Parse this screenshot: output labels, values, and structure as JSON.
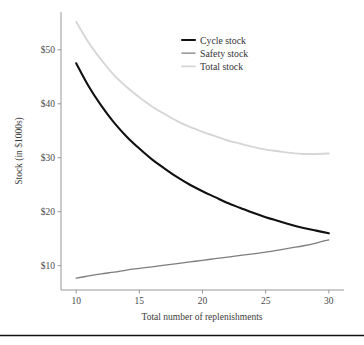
{
  "figure": {
    "background_color": "#ffffff",
    "bottom_rule_color": "#111111",
    "axis_color": "#8c8c8c"
  },
  "chart_data": {
    "type": "line",
    "title": "",
    "subtitle": "",
    "xlabel": "Total number of replenishments",
    "ylabel": "Stock (in $1000s)",
    "xlim": [
      8.8,
      31.2
    ],
    "ylim": [
      5.5,
      57.0
    ],
    "xticks": [
      10,
      15,
      20,
      25,
      30
    ],
    "xticklabels": [
      "10",
      "15",
      "20",
      "25",
      "30"
    ],
    "yticks": [
      10,
      20,
      30,
      40,
      50
    ],
    "yticklabels": [
      "$10",
      "$20",
      "$30",
      "$40",
      "$50"
    ],
    "grid": false,
    "legend_position": "upper center",
    "x": [
      10,
      11,
      12,
      13,
      14,
      15,
      16,
      17,
      18,
      19,
      20,
      21,
      22,
      23,
      24,
      25,
      26,
      27,
      28,
      29,
      30
    ],
    "series": [
      {
        "name": "Cycle stock",
        "color": "#111111",
        "width": 2.1,
        "values": [
          47.5,
          43.2,
          39.6,
          36.5,
          33.9,
          31.7,
          29.7,
          28.0,
          26.4,
          25.0,
          23.8,
          22.7,
          21.6,
          20.7,
          19.8,
          19.0,
          18.3,
          17.6,
          17.0,
          16.5,
          16.0
        ]
      },
      {
        "name": "Safety stock",
        "color": "#7d7d7d",
        "width": 1.3,
        "values": [
          7.7,
          8.1,
          8.5,
          8.8,
          9.2,
          9.5,
          9.8,
          10.1,
          10.4,
          10.7,
          11.0,
          11.3,
          11.6,
          11.9,
          12.2,
          12.5,
          12.9,
          13.3,
          13.7,
          14.2,
          14.8
        ]
      },
      {
        "name": "Total stock",
        "color": "#d6d6d6",
        "width": 1.9,
        "values": [
          55.2,
          51.3,
          48.1,
          45.3,
          43.1,
          41.2,
          39.5,
          38.1,
          36.8,
          35.7,
          34.8,
          34.0,
          33.2,
          32.6,
          32.0,
          31.5,
          31.2,
          30.9,
          30.7,
          30.7,
          30.8
        ]
      }
    ],
    "legend": [
      {
        "label": "Cycle stock",
        "color": "#111111",
        "width": 2.1
      },
      {
        "label": "Safety stock",
        "color": "#7d7d7d",
        "width": 1.3
      },
      {
        "label": "Total stock",
        "color": "#d6d6d6",
        "width": 1.9
      }
    ]
  }
}
